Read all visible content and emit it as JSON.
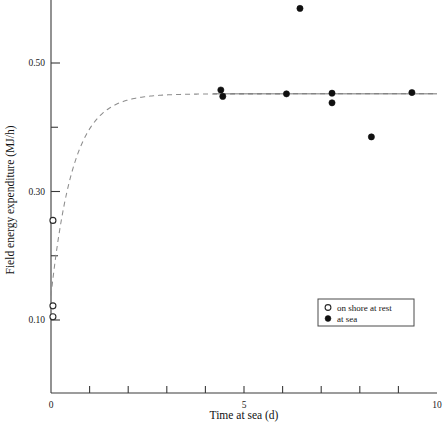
{
  "chart_data": {
    "type": "scatter",
    "title": "",
    "xlabel": "Time at sea (d)",
    "ylabel": "Field energy expenditure (MJ/h)",
    "xlim": [
      0,
      10
    ],
    "ylim": [
      0.04,
      0.6
    ],
    "grid": false,
    "x_ticks": [
      0,
      1,
      2,
      3,
      4,
      5,
      6,
      7,
      8,
      9,
      10
    ],
    "x_tick_labels": [
      "0",
      "",
      "",
      "",
      "",
      "5",
      "",
      "",
      "",
      "",
      "10"
    ],
    "y_ticks": [
      0.1,
      0.2,
      0.3,
      0.4,
      0.5
    ],
    "y_tick_labels": [
      "0.10",
      "",
      "0.30",
      "",
      "0.50"
    ],
    "legend_position": "lower right",
    "series": [
      {
        "name": "on shore at rest",
        "marker": "open-circle",
        "points": [
          {
            "x": 0.05,
            "y": 0.255
          },
          {
            "x": 0.05,
            "y": 0.122
          },
          {
            "x": 0.05,
            "y": 0.105
          }
        ]
      },
      {
        "name": "at sea",
        "marker": "filled-circle",
        "points": [
          {
            "x": 4.4,
            "y": 0.458
          },
          {
            "x": 4.45,
            "y": 0.448
          },
          {
            "x": 6.1,
            "y": 0.452
          },
          {
            "x": 6.45,
            "y": 0.585
          },
          {
            "x": 7.28,
            "y": 0.453
          },
          {
            "x": 7.28,
            "y": 0.438
          },
          {
            "x": 8.3,
            "y": 0.385
          },
          {
            "x": 9.35,
            "y": 0.454
          }
        ]
      }
    ],
    "fit_curve": {
      "name": "exponential-rise-fit",
      "style": "dashed",
      "asymptote": 0.452,
      "y_start": 0.138,
      "rate": 1.75,
      "x_from": 0.0,
      "x_to": 10.0
    },
    "asymptote_line": {
      "name": "asymptote",
      "y": 0.452,
      "x_from": 4.2,
      "x_to": 10.0
    }
  },
  "legend": {
    "entries": [
      {
        "label": "on shore at rest",
        "marker": "open-circle"
      },
      {
        "label": "at sea",
        "marker": "filled-circle"
      }
    ]
  }
}
